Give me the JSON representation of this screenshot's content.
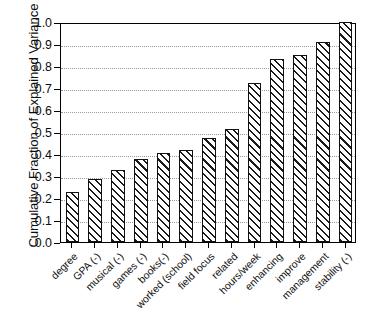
{
  "chart_data": {
    "type": "bar",
    "title": "",
    "xlabel": "",
    "ylabel": "Cumulative Fraction of Explained Variance",
    "ylim": [
      0.0,
      1.0
    ],
    "ytick_labels": [
      "0.0",
      "0.1",
      "0.2",
      "0.3",
      "0.4",
      "0.5",
      "0.6",
      "0.7",
      "0.8",
      "0.9",
      "1.0"
    ],
    "ytick_values": [
      0.0,
      0.1,
      0.2,
      0.3,
      0.4,
      0.5,
      0.6,
      0.7,
      0.8,
      0.9,
      1.0
    ],
    "grid": true,
    "legend": null,
    "categories": [
      "degree",
      "GPA (-)",
      "musical (-)",
      "games (-)",
      "books(-)",
      "worked (school)",
      "field focus",
      "related",
      "hours/week",
      "enhancing",
      "improve",
      "management",
      "stability (-)"
    ],
    "values": [
      0.228,
      0.287,
      0.328,
      0.377,
      0.406,
      0.416,
      0.475,
      0.515,
      0.723,
      0.832,
      0.852,
      0.911,
      1.0
    ],
    "bar_style": {
      "fill": "#ffffff",
      "edge": "#111111",
      "hatch": "/"
    }
  }
}
